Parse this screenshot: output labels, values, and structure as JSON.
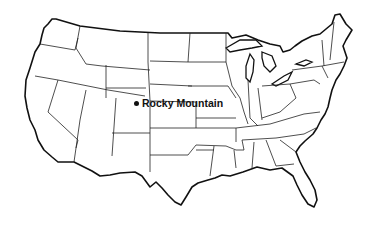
{
  "map": {
    "type": "outline map of the contiguous United States",
    "style": "black-and-white line drawing with state borders",
    "colors": {
      "background": "#ffffff",
      "lines": "#111111"
    },
    "markers": [
      {
        "label": "Rocky Mountain",
        "icon": "dot",
        "approx_location": "northern Colorado"
      }
    ]
  }
}
